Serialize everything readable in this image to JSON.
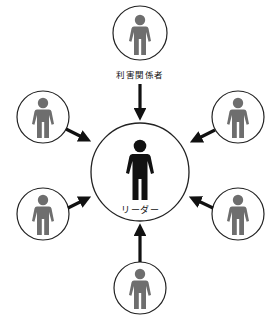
{
  "diagram": {
    "type": "stakeholder-leader-relationship",
    "center": {
      "label": "リーダー",
      "icon": "person-icon",
      "color": "#111111",
      "cx": 140,
      "cy": 172,
      "r": 49
    },
    "stakeholder_label": "利害関係者",
    "stakeholder_color": "#6e6e6e",
    "nodes": [
      {
        "id": "top",
        "cx": 140,
        "cy": 33,
        "r": 27,
        "labeled": true
      },
      {
        "id": "upper-left",
        "cx": 43,
        "cy": 117,
        "r": 26
      },
      {
        "id": "upper-right",
        "cx": 238,
        "cy": 117,
        "r": 26
      },
      {
        "id": "lower-left",
        "cx": 43,
        "cy": 214,
        "r": 26
      },
      {
        "id": "lower-right",
        "cx": 238,
        "cy": 214,
        "r": 26
      },
      {
        "id": "bottom",
        "cx": 140,
        "cy": 288,
        "r": 26
      }
    ],
    "arrows": [
      {
        "from": "top",
        "direction": "toward-center"
      },
      {
        "from": "upper-left",
        "direction": "toward-center"
      },
      {
        "from": "upper-right",
        "direction": "toward-center"
      },
      {
        "from": "lower-left",
        "direction": "toward-center"
      },
      {
        "from": "lower-right",
        "direction": "toward-center"
      },
      {
        "from": "bottom",
        "direction": "toward-center"
      }
    ]
  }
}
